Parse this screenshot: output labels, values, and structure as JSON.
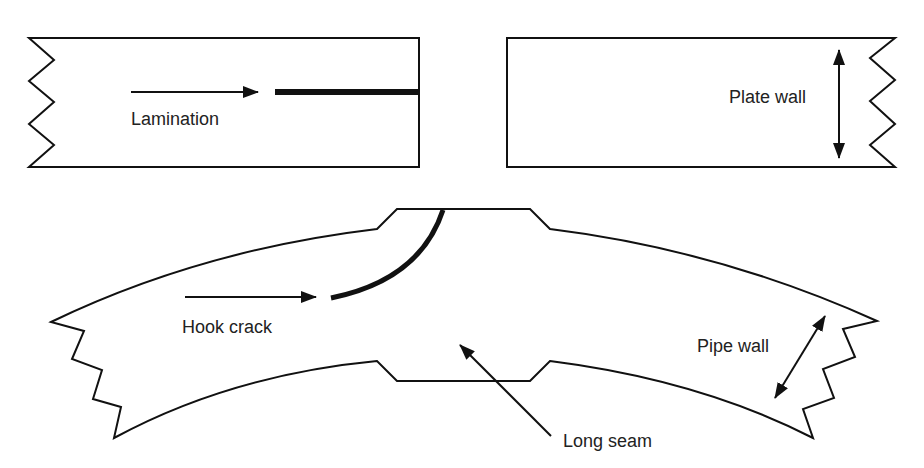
{
  "diagram": {
    "type": "defect-illustration",
    "colors": {
      "stroke": "#111111",
      "text": "#222222",
      "background": "#ffffff"
    },
    "labels": {
      "lamination": "Lamination",
      "plate_wall": "Plate wall",
      "hook_crack": "Hook crack",
      "pipe_wall": "Pipe wall",
      "long_seam": "Long seam"
    },
    "panels": [
      {
        "id": "plate-left",
        "description": "Plate section with lamination defect",
        "annotations": [
          "Lamination"
        ]
      },
      {
        "id": "plate-right",
        "description": "Plate section showing wall thickness",
        "annotations": [
          "Plate wall"
        ]
      },
      {
        "id": "pipe-section",
        "description": "Curved pipe wall section with long seam and hook crack",
        "annotations": [
          "Hook crack",
          "Pipe wall",
          "Long seam"
        ]
      }
    ]
  }
}
